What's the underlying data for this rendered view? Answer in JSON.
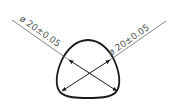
{
  "drawing": {
    "shape": "reuleaux-triangle-profile",
    "dimensions": [
      {
        "label": "ø 20±0.05",
        "symbol": "ø",
        "value": "20",
        "tolerance": "±0.05",
        "position": "left"
      },
      {
        "label": "ø 20±0.05",
        "symbol": "ø",
        "value": "20",
        "tolerance": "±0.05",
        "position": "right"
      }
    ],
    "colors": {
      "outline": "#1a1a1a",
      "leader": "#666666",
      "text": "#555555",
      "background": "#ffffff"
    }
  }
}
